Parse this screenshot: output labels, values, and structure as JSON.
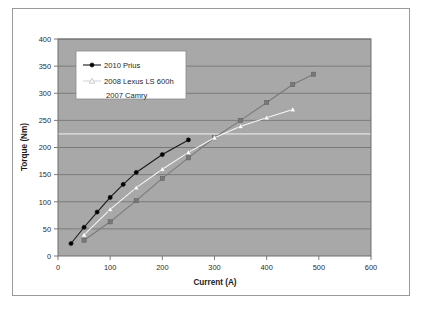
{
  "chart_data": {
    "type": "line",
    "title": "",
    "xlabel": "Current (A)",
    "ylabel": "Torque (Nm)",
    "xlim": [
      0,
      600
    ],
    "ylim": [
      0,
      400
    ],
    "xticks": [
      0,
      100,
      200,
      300,
      400,
      500,
      600
    ],
    "yticks": [
      0,
      50,
      100,
      150,
      200,
      250,
      300,
      350,
      400
    ],
    "grid": "horizontal",
    "legend_position": "upper-left",
    "plot_background": "#a8a8a8",
    "series": [
      {
        "name": "2010 Prius",
        "color": "#1a1a1a",
        "marker": "circle",
        "marker_color": "#000000",
        "x": [
          25,
          50,
          75,
          100,
          125,
          150,
          200,
          250
        ],
        "y": [
          23,
          53,
          81,
          108,
          132,
          154,
          187,
          214
        ]
      },
      {
        "name": "2008 Lexus LS 600h",
        "color": "#f5f5f5",
        "marker": "triangle",
        "marker_color": "#ffffff",
        "x": [
          50,
          100,
          150,
          200,
          250,
          300,
          350,
          400,
          450
        ],
        "y": [
          39,
          86,
          126,
          160,
          191,
          218,
          239,
          255,
          270
        ]
      },
      {
        "name": "2007 Camry",
        "color": "#7a7a7a",
        "marker": "square",
        "marker_color": "#787878",
        "x": [
          50,
          100,
          150,
          200,
          250,
          300,
          350,
          400,
          450,
          490
        ],
        "y": [
          29,
          63,
          102,
          143,
          181,
          218,
          250,
          283,
          316,
          335
        ]
      }
    ]
  },
  "axis": {
    "y_title": "Torque (Nm)",
    "x_title": "Current (A)",
    "x_tick_labels": [
      "0",
      "100",
      "200",
      "300",
      "400",
      "500",
      "600"
    ],
    "y_tick_labels": [
      "0",
      "50",
      "100",
      "150",
      "200",
      "250",
      "300",
      "350",
      "400"
    ]
  },
  "legend": {
    "entries": [
      {
        "label": "2010 Prius",
        "marker": "circle-line"
      },
      {
        "label": "2008 Lexus LS 600h",
        "marker": "triangle-line"
      },
      {
        "label": "2007 Camry",
        "marker": "none"
      }
    ]
  }
}
